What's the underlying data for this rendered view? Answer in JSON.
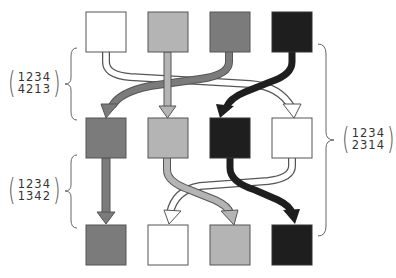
{
  "colors": {
    "c1": "#ffffff",
    "c2": "#b4b4b4",
    "c3": "#7b7b7b",
    "c4": "#1e1e1e",
    "stroke": "#555555"
  },
  "rows": [
    {
      "name": "top-row",
      "squares": [
        "white",
        "light-gray",
        "dark-gray",
        "black"
      ]
    },
    {
      "name": "middle-row",
      "squares": [
        "dark-gray",
        "light-gray",
        "black",
        "white"
      ]
    },
    {
      "name": "bottom-row",
      "squares": [
        "dark-gray",
        "white",
        "light-gray",
        "black"
      ]
    }
  ],
  "permutations": {
    "first": {
      "top": "1234",
      "bottom": "4213"
    },
    "second": {
      "top": "1234",
      "bottom": "1342"
    },
    "composite": {
      "top": "1234",
      "bottom": "2314"
    }
  },
  "arrows": {
    "first": [
      {
        "from": 1,
        "to": 4,
        "color": "white"
      },
      {
        "from": 2,
        "to": 2,
        "color": "light-gray"
      },
      {
        "from": 3,
        "to": 1,
        "color": "dark-gray"
      },
      {
        "from": 4,
        "to": 3,
        "color": "black"
      }
    ],
    "second": [
      {
        "from": 1,
        "to": 1,
        "color": "dark-gray"
      },
      {
        "from": 2,
        "to": 3,
        "color": "light-gray"
      },
      {
        "from": 3,
        "to": 4,
        "color": "black"
      },
      {
        "from": 4,
        "to": 2,
        "color": "white"
      }
    ]
  }
}
